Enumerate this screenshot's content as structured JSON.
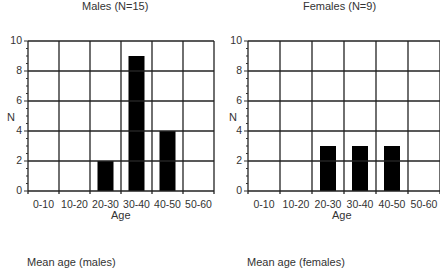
{
  "chart_data": [
    {
      "type": "bar",
      "title": "Males (N=15)",
      "xlabel": "Age",
      "ylabel": "N",
      "categories": [
        "0-10",
        "10-20",
        "20-30",
        "30-40",
        "40-50",
        "50-60"
      ],
      "values": [
        0,
        0,
        2,
        9,
        4,
        0
      ],
      "ylim": [
        0,
        10
      ],
      "yticks": [
        0,
        2,
        4,
        6,
        8,
        10
      ],
      "grid": true,
      "bar_color": "#000000"
    },
    {
      "type": "bar",
      "title": "Females (N=9)",
      "xlabel": "Age",
      "ylabel": "N",
      "categories": [
        "0-10",
        "10-20",
        "20-30",
        "30-40",
        "40-50",
        "50-60"
      ],
      "values": [
        0,
        0,
        3,
        3,
        3,
        0
      ],
      "ylim": [
        0,
        10
      ],
      "yticks": [
        0,
        2,
        4,
        6,
        8,
        10
      ],
      "grid": true,
      "bar_color": "#000000"
    }
  ],
  "footnotes": {
    "males": "Mean age (males)",
    "females": "Mean age (females)"
  }
}
